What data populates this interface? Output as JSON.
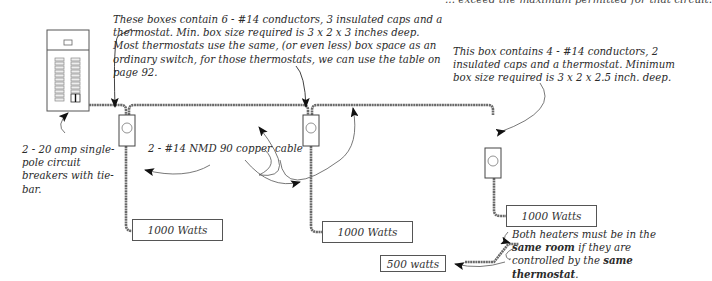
{
  "top_cutoff_text": "... exceed the maximum permitted for that circuit.",
  "notes": {
    "boxes_6_conductors": "These boxes contain 6  - #14 conductors, 3 insulated caps and a thermostat.  Min. box size required is  3 x 2 x 3 inches deep. Most thermostats use the same, (or even less) box space as an ordinary switch, for those thermostats, we can use the table on page 92.",
    "box_4_conductors": "This box contains 4 - #14 conductors, 2 insulated caps and a thermostat.  Minimum box size required is  3 x 2 x 2.5 inch. deep.",
    "breakers": "2 - 20 amp single-pole circuit breakers with tie-bar.",
    "cable": "2 - #14 NMD 90 copper cable",
    "same_room_part1": "Both heaters must be in the ",
    "same_room_bold1": "same room",
    "same_room_part2": " if they are controlled by the ",
    "same_room_bold2": "same thermostat",
    "same_room_part3": "."
  },
  "loads": [
    {
      "label": "1000 Watts"
    },
    {
      "label": "1000 Watts"
    },
    {
      "label": "1000 Watts"
    },
    {
      "label": "500 watts"
    }
  ],
  "components": {
    "panel": "electrical-panel-icon",
    "thermostat_boxes": 3
  }
}
